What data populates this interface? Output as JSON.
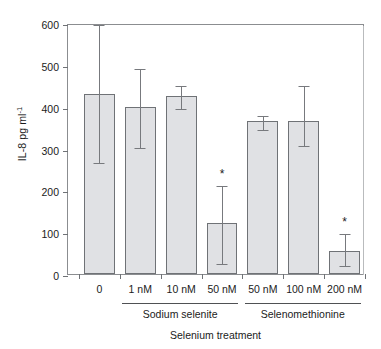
{
  "chart_data": {
    "type": "bar",
    "title": "",
    "xlabel": "Selenium treatment",
    "ylabel": "IL-8 pg ml",
    "ylabel_exponent": "-1",
    "ylim": [
      0,
      600
    ],
    "yticks": [
      0,
      100,
      200,
      300,
      400,
      500,
      600
    ],
    "ytick_labels": [
      "0",
      "100",
      "200",
      "300",
      "400",
      "500",
      "600"
    ],
    "grid": false,
    "legend": "none",
    "categories": [
      "0",
      "1 nM",
      "10 nM",
      "50 nM",
      "50 nM",
      "100 nM",
      "200 nM"
    ],
    "values": [
      430,
      400,
      425,
      122,
      365,
      365,
      55
    ],
    "err_low": [
      270,
      305,
      400,
      28,
      350,
      310,
      25
    ],
    "err_high": [
      600,
      495,
      455,
      215,
      382,
      455,
      100
    ],
    "significance": [
      "",
      "",
      "",
      "*",
      "",
      "",
      "*"
    ],
    "groups": [
      {
        "label": "Sodium selenite",
        "start_index": 1,
        "end_index": 3
      },
      {
        "label": "Selenomethionine",
        "start_index": 4,
        "end_index": 6
      }
    ],
    "bar_fill_color": "#e0e1e4",
    "bar_edge_color": "#6f7276",
    "error_color": "#77797d",
    "axis_color": "#8b8d90"
  }
}
